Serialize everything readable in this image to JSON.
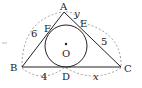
{
  "diagram": {
    "type": "triangle-with-incircle",
    "points": {
      "A": {
        "label": "A",
        "x": 64,
        "y": 12
      },
      "B": {
        "label": "B",
        "x": 22,
        "y": 67
      },
      "C": {
        "label": "C",
        "x": 121,
        "y": 67
      },
      "D": {
        "label": "D",
        "x": 65,
        "y": 67
      },
      "E": {
        "label": "E",
        "x": 78,
        "y": 23
      },
      "F": {
        "label": "F",
        "x": 48,
        "y": 29
      },
      "O": {
        "label": "O",
        "x": 66,
        "y": 45
      }
    },
    "circle": {
      "cx": 66,
      "cy": 45,
      "r": 21
    },
    "lengths": {
      "BA": "6",
      "AE": "y",
      "EC": "5",
      "BD": "4",
      "DC": "x"
    },
    "colors": {
      "line": "#222222",
      "dashed": "#888888"
    }
  }
}
